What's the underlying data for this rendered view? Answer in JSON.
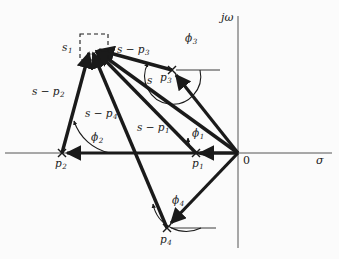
{
  "figure": {
    "kind": "s-plane-pole-vector-diagram",
    "width": 339,
    "height": 259,
    "background_color": "#fbfbfb",
    "ink_color": "#1a1a1a"
  },
  "axes": {
    "imaginary_label": "jω",
    "real_label": "σ",
    "origin_label": "0",
    "origin_px": {
      "x": 238,
      "y": 153
    },
    "real_axis": {
      "x1": 5,
      "y1": 153,
      "x2": 332,
      "y2": 153
    },
    "imag_axis": {
      "x1": 238,
      "y1": 16,
      "x2": 238,
      "y2": 248
    }
  },
  "test_point": {
    "label": "s",
    "sub": "1",
    "px": {
      "x": 92,
      "y": 47
    },
    "marker": "dashed-box",
    "box": {
      "x": 80,
      "y": 34,
      "w": 28,
      "h": 26
    }
  },
  "poles": [
    {
      "id": "p1",
      "label": "p",
      "sub": "1",
      "px": {
        "x": 196,
        "y": 153
      },
      "marker": "cross"
    },
    {
      "id": "p2",
      "label": "p",
      "sub": "2",
      "px": {
        "x": 62,
        "y": 153
      },
      "marker": "cross"
    },
    {
      "id": "p3",
      "label": "p",
      "sub": "3",
      "px": {
        "x": 172,
        "y": 70
      },
      "marker": "cross"
    },
    {
      "id": "p4",
      "label": "p",
      "sub": "4",
      "px": {
        "x": 167,
        "y": 228
      },
      "marker": "cross"
    }
  ],
  "vectors": [
    {
      "id": "v-s-p1",
      "label": "s − p",
      "sub": "1",
      "from": {
        "x": 196,
        "y": 153
      },
      "to": {
        "x": 92,
        "y": 47
      }
    },
    {
      "id": "v-s-p2",
      "label": "s − p",
      "sub": "2",
      "from": {
        "x": 62,
        "y": 153
      },
      "to": {
        "x": 92,
        "y": 47
      }
    },
    {
      "id": "v-s-p3",
      "label": "s − p",
      "sub": "3",
      "from": {
        "x": 172,
        "y": 70
      },
      "to": {
        "x": 92,
        "y": 47
      }
    },
    {
      "id": "v-s-p4",
      "label": "s − p",
      "sub": "4",
      "from": {
        "x": 167,
        "y": 228
      },
      "to": {
        "x": 92,
        "y": 47
      }
    },
    {
      "id": "v-s",
      "label": "s",
      "sub": "",
      "from": {
        "x": 238,
        "y": 153
      },
      "to": {
        "x": 92,
        "y": 47
      }
    }
  ],
  "position_vectors": [
    {
      "id": "pv-p1",
      "from": {
        "x": 238,
        "y": 153
      },
      "to": {
        "x": 196,
        "y": 153
      }
    },
    {
      "id": "pv-p2",
      "from": {
        "x": 238,
        "y": 153
      },
      "to": {
        "x": 62,
        "y": 153
      }
    },
    {
      "id": "pv-p3",
      "from": {
        "x": 238,
        "y": 153
      },
      "to": {
        "x": 172,
        "y": 70
      }
    },
    {
      "id": "pv-p4",
      "from": {
        "x": 238,
        "y": 153
      },
      "to": {
        "x": 167,
        "y": 228
      }
    }
  ],
  "angles": [
    {
      "id": "phi1",
      "label": "ϕ",
      "sub": "1",
      "at": "p1"
    },
    {
      "id": "phi2",
      "label": "ϕ",
      "sub": "2",
      "at": "p2"
    },
    {
      "id": "phi3",
      "label": "ϕ",
      "sub": "3",
      "at": "p3"
    },
    {
      "id": "phi4",
      "label": "ϕ",
      "sub": "4",
      "at": "p4"
    }
  ],
  "labels": {
    "s1": {
      "text": "s",
      "sub": "1",
      "x": 62,
      "y": 42
    },
    "s_minus_p3": {
      "text": "s − p",
      "sub": "3",
      "x": 117,
      "y": 44
    },
    "s_minus_p2": {
      "text": "s − p",
      "sub": "2",
      "x": 32,
      "y": 86
    },
    "s_minus_p4": {
      "text": "s − p",
      "sub": "4",
      "x": 85,
      "y": 108
    },
    "s_minus_p1": {
      "text": "s − p",
      "sub": "1",
      "x": 137,
      "y": 122
    },
    "s_vec": {
      "text": "s",
      "sub": "",
      "x": 147,
      "y": 75
    },
    "p1": {
      "text": "p",
      "sub": "1",
      "x": 192,
      "y": 165
    },
    "p2": {
      "text": "p",
      "sub": "2",
      "x": 57,
      "y": 165
    },
    "p3": {
      "text": "p",
      "sub": "3",
      "x": 162,
      "y": 77
    },
    "p4": {
      "text": "p",
      "sub": "4",
      "x": 161,
      "y": 241
    },
    "phi1": {
      "text": "ϕ",
      "sub": "1",
      "x": 192,
      "y": 132
    },
    "phi2": {
      "text": "ϕ",
      "sub": "2",
      "x": 91,
      "y": 136
    },
    "phi3": {
      "text": "ϕ",
      "sub": "3",
      "x": 185,
      "y": 41
    },
    "phi4": {
      "text": "ϕ",
      "sub": "4",
      "x": 172,
      "y": 199
    },
    "jw": {
      "text": "jω",
      "sub": "",
      "x": 222,
      "y": 14
    },
    "sigma": {
      "text": "σ",
      "sub": "",
      "x": 318,
      "y": 160
    },
    "zero": {
      "text": "0",
      "sub": "",
      "x": 243,
      "y": 158
    }
  }
}
